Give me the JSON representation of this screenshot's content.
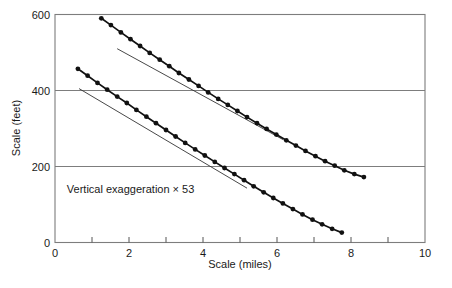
{
  "figure": {
    "background": "#ffffff",
    "line_color": "#111111",
    "grid_color": "#7d7d7d",
    "text_color": "#1a1a1a"
  },
  "chart_data": {
    "type": "scatter",
    "title": "",
    "xlabel": "Scale (miles)",
    "ylabel": "Scale (feet)",
    "xlim": [
      0,
      10
    ],
    "ylim": [
      0,
      600
    ],
    "x_tick_labels": [
      0,
      2,
      4,
      6,
      8,
      10
    ],
    "x_minor_ticks": [
      1,
      2,
      3,
      4,
      5,
      6,
      7,
      8,
      9
    ],
    "y_tick_labels": [
      0,
      200,
      400,
      600
    ],
    "gridlines_y": [
      200,
      400
    ],
    "grid_on": true,
    "legend": "none",
    "annotation": {
      "text": "Vertical exaggeration × 53",
      "x": 0.32,
      "y": 140
    },
    "series": [
      {
        "name": "upper-profile",
        "marker": "filled-circle",
        "x": [
          1.25,
          1.51,
          1.78,
          2.04,
          2.3,
          2.56,
          2.83,
          3.09,
          3.35,
          3.62,
          3.88,
          4.14,
          4.41,
          4.67,
          4.93,
          5.19,
          5.46,
          5.72,
          5.98,
          6.25,
          6.51,
          6.77,
          7.04,
          7.3,
          7.56,
          7.82,
          8.09,
          8.35
        ],
        "y": [
          590,
          572,
          553,
          535,
          517,
          499,
          481,
          464,
          446,
          429,
          412,
          395,
          378,
          362,
          346,
          330,
          314,
          299,
          284,
          269,
          255,
          241,
          227,
          214,
          202,
          190,
          180,
          172
        ]
      },
      {
        "name": "lower-profile",
        "marker": "filled-circle",
        "x": [
          0.62,
          0.88,
          1.15,
          1.41,
          1.68,
          1.94,
          2.2,
          2.47,
          2.73,
          3.0,
          3.26,
          3.52,
          3.79,
          4.05,
          4.32,
          4.58,
          4.85,
          5.11,
          5.37,
          5.64,
          5.9,
          6.16,
          6.43,
          6.69,
          6.96,
          7.22,
          7.49,
          7.75
        ],
        "y": [
          457,
          439,
          420,
          402,
          384,
          367,
          349,
          331,
          314,
          296,
          279,
          262,
          245,
          229,
          212,
          196,
          180,
          164,
          148,
          132,
          117,
          103,
          88,
          74,
          60,
          48,
          36,
          26
        ]
      }
    ],
    "tangent_lines": [
      {
        "x1": 1.68,
        "y1": 510,
        "x2": 6.16,
        "y2": 271
      },
      {
        "x1": 0.65,
        "y1": 405,
        "x2": 5.19,
        "y2": 143
      }
    ]
  }
}
